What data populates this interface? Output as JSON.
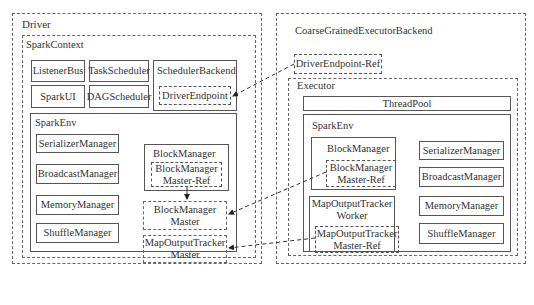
{
  "driver": {
    "title": "Driver",
    "spark_context": {
      "title": "SparkContext",
      "components": {
        "listener_bus": "ListenerBus",
        "task_scheduler": "TaskScheduler",
        "scheduler_backend": "SchedulerBackend",
        "spark_ui": "SparkUI",
        "dag_scheduler": "DAGScheduler",
        "driver_endpoint": "DriverEndpoint"
      },
      "spark_env": {
        "title": "SparkEnv",
        "managers": [
          "SerializerManager",
          "BroadcastManager",
          "MemoryManager",
          "ShuffleManager",
          "RpcEnv"
        ],
        "block_manager": {
          "title": "BlockManager",
          "ref": "BlockManager\nMaster-Ref"
        },
        "block_manager_master": "BlockManager\nMaster",
        "map_output_tracker_master": "MapOutputTracker\nMaster"
      }
    }
  },
  "backend": {
    "title": "CoarseGrainedExecutorBackend",
    "driver_endpoint_ref": "DriverEndpoint-Ref",
    "executor": {
      "title": "Executor",
      "thread_pool": "ThreadPool",
      "spark_env": {
        "title": "SparkEnv",
        "block_manager": {
          "title": "BlockManager",
          "ref": "BlockManager\nMaster-Ref"
        },
        "map_output_tracker_worker": {
          "title": "MapOutputTracker\nWorker",
          "ref": "MapOutputTracker\nMaster-Ref"
        },
        "managers": [
          "SerializerManager",
          "BroadcastManager",
          "MemoryManager",
          "ShuffleManager",
          "RpcEnv"
        ]
      }
    }
  }
}
